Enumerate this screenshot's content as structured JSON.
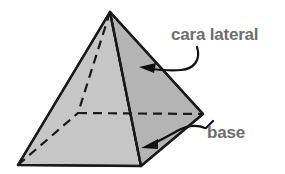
{
  "figure": {
    "shape": "square-based pyramid",
    "background_color": "#ffffff",
    "outline_color": "#1a1a1a",
    "label_color": "#6e6e6e",
    "faces": {
      "left_lateral_face_color": "#c4c4c4",
      "right_lateral_face_color": "#b3b3b3",
      "base_face_color": "#a8a8a8"
    },
    "vertices": {
      "apex": [
        110,
        12
      ],
      "base_left": [
        18,
        165
      ],
      "base_front": [
        141,
        166
      ],
      "base_right": [
        203,
        114
      ],
      "base_back_hidden": [
        78,
        113
      ]
    },
    "hidden_edges_style": "dashed"
  },
  "labels": {
    "lateral_face": {
      "text": "cara lateral",
      "points_to": "right lateral face",
      "arrow": "curved-arrow-left"
    },
    "base": {
      "text": "base",
      "points_to": "base face",
      "arrow": "curved-arrow-left"
    }
  }
}
